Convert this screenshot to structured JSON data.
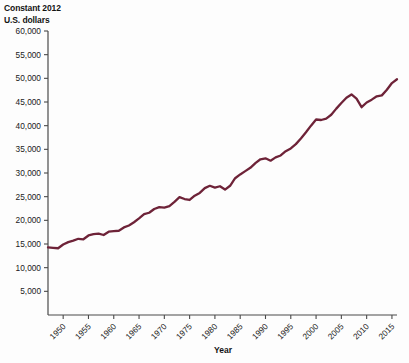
{
  "chart_data": {
    "type": "line",
    "title": "",
    "ylabel": "Constant 2012 U.S. dollars",
    "xlabel": "Year",
    "grid": false,
    "legend": null,
    "line_color": "#6e2338",
    "ylim": [
      0,
      60000
    ],
    "ytick_labels": [
      "60,000",
      "55,000",
      "50,000",
      "45,000",
      "40,000",
      "35,000",
      "30,000",
      "25,000",
      "20,000",
      "15,000",
      "10,000",
      "5,000"
    ],
    "ytick_values": [
      60000,
      55000,
      50000,
      45000,
      40000,
      35000,
      30000,
      25000,
      20000,
      15000,
      10000,
      5000
    ],
    "xlim": [
      1947,
      2016
    ],
    "xtick_labels": [
      "1950",
      "1955",
      "1960",
      "1965",
      "1970",
      "1975",
      "1980",
      "1985",
      "1990",
      "1995",
      "2000",
      "2005",
      "2010",
      "2015"
    ],
    "xtick_values": [
      1950,
      1955,
      1960,
      1965,
      1970,
      1975,
      1980,
      1985,
      1990,
      1995,
      2000,
      2005,
      2010,
      2015
    ],
    "x": [
      1947,
      1948,
      1949,
      1950,
      1951,
      1952,
      1953,
      1954,
      1955,
      1956,
      1957,
      1958,
      1959,
      1960,
      1961,
      1962,
      1963,
      1964,
      1965,
      1966,
      1967,
      1968,
      1969,
      1970,
      1971,
      1972,
      1973,
      1974,
      1975,
      1976,
      1977,
      1978,
      1979,
      1980,
      1981,
      1982,
      1983,
      1984,
      1985,
      1986,
      1987,
      1988,
      1989,
      1990,
      1991,
      1992,
      1993,
      1994,
      1995,
      1996,
      1997,
      1998,
      1999,
      2000,
      2001,
      2002,
      2003,
      2004,
      2005,
      2006,
      2007,
      2008,
      2009,
      2010,
      2011,
      2012,
      2013,
      2014,
      2015,
      2016
    ],
    "values": [
      14300,
      14200,
      14100,
      14900,
      15400,
      15700,
      16100,
      16000,
      16800,
      17100,
      17200,
      16900,
      17600,
      17700,
      17800,
      18500,
      18900,
      19600,
      20400,
      21300,
      21600,
      22400,
      22800,
      22700,
      23000,
      23900,
      24900,
      24500,
      24300,
      25200,
      25800,
      26800,
      27300,
      26900,
      27200,
      26500,
      27300,
      28900,
      29700,
      30400,
      31100,
      32100,
      32900,
      33100,
      32600,
      33300,
      33700,
      34600,
      35200,
      36100,
      37300,
      38600,
      40000,
      41300,
      41200,
      41500,
      42300,
      43600,
      44800,
      45900,
      46600,
      45700,
      43900,
      44900,
      45500,
      46200,
      46400,
      47600,
      49000,
      49800
    ]
  },
  "chart_data_pixels": {
    "note": "rendered path follows values via linear mapping",
    "plot_left": 48,
    "plot_right": 397,
    "plot_bottom": 315,
    "plot_top": 31
  }
}
